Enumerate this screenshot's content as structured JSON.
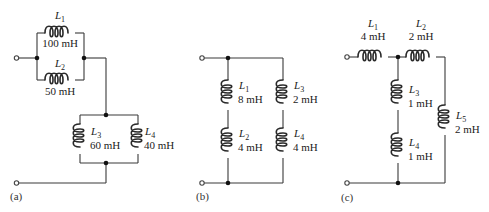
{
  "figure": {
    "panels": [
      {
        "id": "a",
        "label": "(a)",
        "inductors": [
          {
            "name": "L",
            "sub": "1",
            "value": "100 mH"
          },
          {
            "name": "L",
            "sub": "2",
            "value": "50 mH"
          },
          {
            "name": "L",
            "sub": "3",
            "value": "60 mH"
          },
          {
            "name": "L",
            "sub": "4",
            "value": "40 mH"
          }
        ]
      },
      {
        "id": "b",
        "label": "(b)",
        "inductors": [
          {
            "name": "L",
            "sub": "1",
            "value": "8 mH"
          },
          {
            "name": "L",
            "sub": "2",
            "value": "4 mH"
          },
          {
            "name": "L",
            "sub": "3",
            "value": "2 mH"
          },
          {
            "name": "L",
            "sub": "4",
            "value": "4 mH"
          }
        ]
      },
      {
        "id": "c",
        "label": "(c)",
        "inductors": [
          {
            "name": "L",
            "sub": "1",
            "value": "4 mH"
          },
          {
            "name": "L",
            "sub": "2",
            "value": "2 mH"
          },
          {
            "name": "L",
            "sub": "3",
            "value": "1 mH"
          },
          {
            "name": "L",
            "sub": "4",
            "value": "1 mH"
          },
          {
            "name": "L",
            "sub": "5",
            "value": "2 mH"
          }
        ]
      }
    ]
  }
}
